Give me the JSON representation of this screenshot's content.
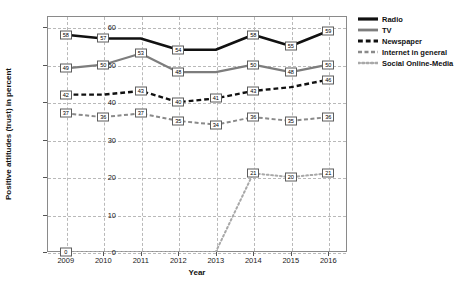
{
  "chart_data": {
    "type": "line",
    "title": "",
    "xlabel": "Year",
    "ylabel": "Positive attitudes (trust) in percent",
    "categories": [
      "2009",
      "2010",
      "2011",
      "2012",
      "2013",
      "2014",
      "2015",
      "2016"
    ],
    "x": [
      2009,
      2010,
      2011,
      2012,
      2013,
      2014,
      2015,
      2016
    ],
    "xlim": [
      2008.5,
      2016.5
    ],
    "ylim": [
      0,
      63
    ],
    "yticks": [
      0,
      10,
      20,
      30,
      40,
      50,
      60
    ],
    "grid": true,
    "legend_position": "right",
    "series": [
      {
        "name": "Radio",
        "color": "#111111",
        "style": "solid",
        "width": 2.6,
        "values": [
          58,
          57,
          57,
          54,
          54,
          58,
          55,
          59
        ],
        "labels": [
          "58",
          "57",
          "",
          "54",
          "",
          "58",
          "55",
          "59"
        ]
      },
      {
        "name": "TV",
        "color": "#7d7d7d",
        "style": "solid",
        "width": 2.2,
        "values": [
          49,
          50,
          53,
          48,
          48,
          50,
          48,
          50
        ],
        "labels": [
          "49",
          "50",
          "53",
          "48",
          "",
          "50",
          "48",
          "50"
        ]
      },
      {
        "name": "Newspaper",
        "color": "#111111",
        "style": "dashed",
        "width": 2.4,
        "values": [
          42,
          42,
          43,
          40,
          41,
          43,
          44,
          46
        ],
        "labels": [
          "42",
          "",
          "43",
          "40",
          "41",
          "43",
          "",
          "46"
        ]
      },
      {
        "name": "Internet in general",
        "color": "#8a8a8a",
        "style": "dashed",
        "width": 2.0,
        "values": [
          37,
          36,
          37,
          35,
          34,
          36,
          35,
          36
        ],
        "labels": [
          "37",
          "36",
          "37",
          "35",
          "34",
          "36",
          "35",
          "36"
        ]
      },
      {
        "name": "Social Online-Media",
        "color": "#a8a8a8",
        "style": "dotted",
        "width": 2.0,
        "values": [
          0,
          0,
          0,
          0,
          0,
          21,
          20,
          21
        ],
        "labels": [
          "0",
          "",
          "",
          "",
          "",
          "21",
          "20",
          "21"
        ]
      }
    ]
  },
  "legend": {
    "items": [
      {
        "label": "Radio"
      },
      {
        "label": "TV"
      },
      {
        "label": "Newspaper"
      },
      {
        "label": "Internet in general"
      },
      {
        "label": "Social Online-Media"
      }
    ]
  }
}
